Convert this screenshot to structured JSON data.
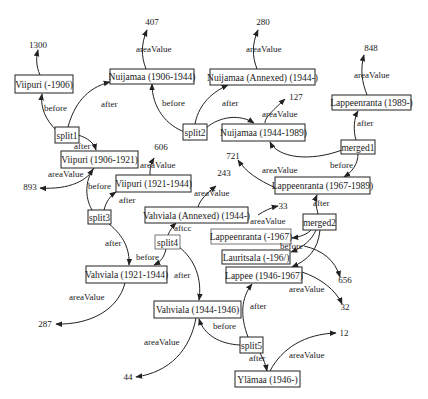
{
  "diagram": {
    "type": "knowledge-graph",
    "nodes": {
      "viipuri_1906": "Viipuri (-1906)",
      "nuijamaa_1906_1944": "Nuijamaa (1906-1944)",
      "nuijamaa_annexed": "Nuijamaa (Annexed) (1944-)",
      "lappeenranta_1989": "Lappeenranta (1989-)",
      "split1": "split1",
      "split2": "split2",
      "nuijamaa_1944_1989": "Nuijamaa (1944-1989)",
      "merged1": "merged1",
      "viipuri_1906_1921": "Viipuri (1906-1921)",
      "viipuri_1921_1944": "Viipuri (1921-1944)",
      "lappeenranta_1967_1989": "Lappeenranta (1967-1989)",
      "split3": "split3",
      "vahviala_annexed": "Vahviala (Annexed) (1944-)",
      "merged2": "merged2",
      "lappeenranta_1967": "Lappeenranta (-1967)",
      "split4": "split4",
      "lauritsala_1967": "Lauritsala (-1967)",
      "vahviala_1921_1944": "Vahviala (1921-1944)",
      "lappee_1946_1967": "Lappee (1946-1967)",
      "vahviala_1944_1946": "Vahviala (1944-1946)",
      "split5": "split5",
      "ylamaa_1946": "Ylämaa (1946-)"
    },
    "values": {
      "v1300": "1300",
      "v407": "407",
      "v280": "280",
      "v848": "848",
      "v127": "127",
      "v606": "606",
      "v893": "893",
      "v721": "721",
      "v243": "243",
      "v33": "33",
      "v656": "656",
      "v32": "32",
      "v287": "287",
      "v44": "44",
      "v12": "12"
    },
    "edge_labels": {
      "before": "before",
      "after": "after",
      "after_blurred": "aftcc",
      "area_value": "areaValue",
      "lauritsala_blurred": "Lauritsala (-196/)"
    }
  }
}
